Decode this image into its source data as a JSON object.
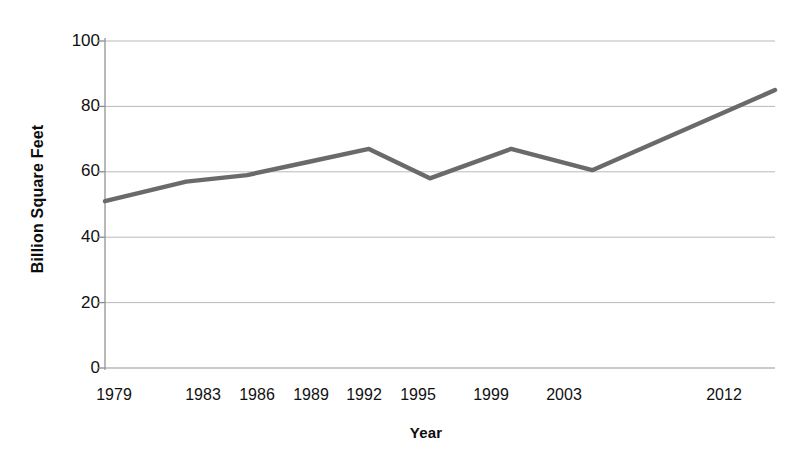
{
  "chart_data": {
    "type": "line",
    "title": "",
    "xlabel": "Year",
    "ylabel": "Billion Square Feet",
    "x": [
      1979,
      1983,
      1986,
      1989,
      1992,
      1995,
      1999,
      2003,
      2012
    ],
    "categories": [
      "1979",
      "1983",
      "1986",
      "1989",
      "1992",
      "1995",
      "1999",
      "2003",
      "2012"
    ],
    "values": [
      51,
      57,
      59,
      63,
      67,
      58,
      67,
      60.5,
      85
    ],
    "series": [
      {
        "name": "Commercial floorspace",
        "values": [
          51,
          57,
          59,
          63,
          67,
          58,
          67,
          60.5,
          85
        ]
      }
    ],
    "ylim": [
      0,
      100
    ],
    "xlim": [
      1979,
      2012
    ],
    "yticks": [
      0,
      20,
      40,
      60,
      80,
      100
    ],
    "ytick_labels": [
      "0",
      "20",
      "40",
      "60",
      "80",
      "100"
    ],
    "xtick_labels": [
      "1979",
      "1983",
      "1986",
      "1989",
      "1992",
      "1995",
      "1999",
      "2003",
      "2012"
    ],
    "grid": true,
    "grid_axis": "y",
    "legend": false,
    "legend_position": "none",
    "line_color": "#6a6a6a",
    "grid_color": "#b9b9b9",
    "axis_color": "#8a8a8a",
    "background_color": "#ffffff",
    "text_color": "#111111",
    "annotations": []
  }
}
